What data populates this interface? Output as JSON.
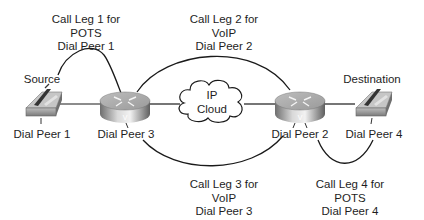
{
  "nodes": {
    "source": {
      "label": "Source",
      "peer": "Dial Peer 1"
    },
    "router_left": {
      "peer": "Dial Peer 3"
    },
    "cloud": {
      "line1": "IP",
      "line2": "Cloud"
    },
    "router_right": {
      "peer": "Dial Peer 2"
    },
    "destination": {
      "label": "Destination",
      "peer": "Dial Peer 4"
    }
  },
  "call_legs": [
    {
      "line1": "Call Leg 1 for",
      "line2": "POTS",
      "line3": "Dial Peer 1"
    },
    {
      "line1": "Call Leg 2 for",
      "line2": "VoIP",
      "line3": "Dial Peer 2"
    },
    {
      "line1": "Call Leg 3 for",
      "line2": "VoIP",
      "line3": "Dial Peer 3"
    },
    {
      "line1": "Call Leg 4 for",
      "line2": "POTS",
      "line3": "Dial Peer 4"
    }
  ],
  "colors": {
    "line": "#1a1a1a",
    "router_top": "#c8c8c8",
    "router_side": "#8e8e8e",
    "phone": "#9a9a9a"
  }
}
